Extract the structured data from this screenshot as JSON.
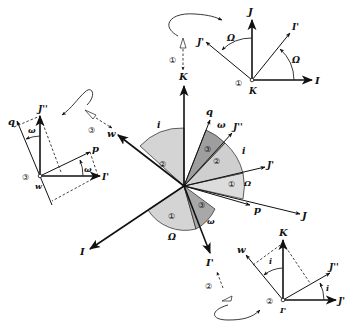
{
  "figure": {
    "colors": {
      "light_sector": "#d4d4d4",
      "mid_sector": "#bdbdbd",
      "dark_sector": "#9a9a9a",
      "ink": "#111111"
    },
    "central": {
      "axes": {
        "K": "K",
        "I": "I",
        "J": "J",
        "I_prime": "I'",
        "J_prime": "J'",
        "J_dprime": "J''",
        "w": "w",
        "p": "p",
        "q": "q"
      },
      "angles": {
        "Omega": "Ω",
        "i": "i",
        "omega": "ω"
      },
      "sector_labels": [
        "①",
        "②",
        "③",
        "①",
        "②",
        "③"
      ]
    },
    "inset_1": {
      "marker": "①",
      "rotation_axis": "K",
      "axes": {
        "I": "I",
        "J": "J",
        "I_prime": "I'",
        "J_prime": "J'"
      },
      "angle": "Ω",
      "viewer_label": "①"
    },
    "inset_2": {
      "marker": "②",
      "rotation_axis": "I'",
      "axes": {
        "K": "K",
        "w": "w",
        "J_prime": "J'",
        "J_dprime": "J''"
      },
      "angle": "i",
      "viewer_label": "②"
    },
    "inset_3": {
      "marker": "③",
      "rotation_axis": "w",
      "axes": {
        "J_dprime": "J''",
        "I_prime": "I'",
        "p": "p",
        "q": "q"
      },
      "angle": "ω",
      "viewer_label": "③"
    }
  }
}
